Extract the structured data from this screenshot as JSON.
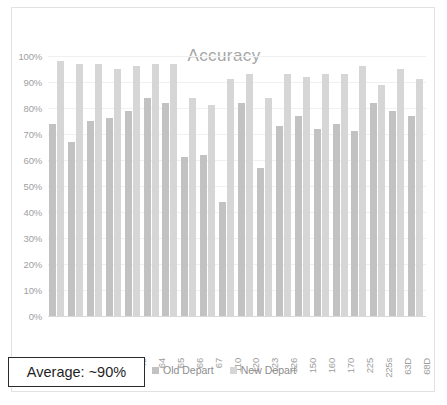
{
  "chart_data": {
    "type": "bar",
    "title": "Accuracy",
    "xlabel": "",
    "ylabel": "",
    "ylim": [
      0,
      1.0
    ],
    "grid": true,
    "legend_position": "bottom",
    "y_tick_labels": [
      "100%",
      "90%",
      "80%",
      "70%",
      "60%",
      "50%",
      "40%",
      "30%",
      "20%",
      "10%",
      "0%"
    ],
    "y_tick_values": [
      100,
      90,
      80,
      70,
      60,
      50,
      40,
      30,
      20,
      10,
      0
    ],
    "categories": [
      "25",
      "41",
      "42",
      "47",
      "48",
      "64",
      "65",
      "66",
      "67",
      "110",
      "120",
      "123",
      "126",
      "150",
      "160",
      "170",
      "225",
      "225s",
      "63D",
      "68D"
    ],
    "series": [
      {
        "name": "Old Depart",
        "color": "#c2c2c2",
        "values": [
          74,
          67,
          75,
          76,
          79,
          84,
          82,
          61,
          62,
          44,
          82,
          57,
          73,
          77,
          72,
          74,
          71,
          82,
          79,
          77
        ]
      },
      {
        "name": "New Depart",
        "color": "#d6d6d6",
        "values": [
          98,
          97,
          97,
          95,
          96,
          97,
          97,
          84,
          81,
          91,
          93,
          84,
          93,
          92,
          93,
          93,
          96,
          89,
          95,
          91
        ]
      }
    ]
  },
  "footer": {
    "average_label": "Average: ~90%"
  },
  "legend": {
    "items": [
      {
        "label": "Old Depart",
        "color": "#c2c2c2"
      },
      {
        "label": "New Depart",
        "color": "#d6d6d6"
      }
    ]
  }
}
